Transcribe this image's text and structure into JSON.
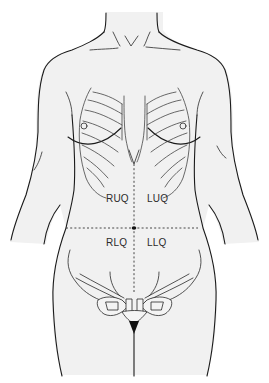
{
  "figure": {
    "colors": {
      "background": "#ffffff",
      "skin_fill": "#f1f1f1",
      "outline": "#1b1b1b",
      "divider_lines": "#333333",
      "label_text": "#2b2b2b"
    },
    "dividers": {
      "vertical": "midline (dashed)",
      "horizontal": "transumbilical line (dashed)",
      "intersection": "umbilicus"
    },
    "quadrants": [
      {
        "id": "ruq",
        "label": "RUQ"
      },
      {
        "id": "luq",
        "label": "LUQ"
      },
      {
        "id": "rlq",
        "label": "RLQ"
      },
      {
        "id": "llq",
        "label": "LLQ"
      }
    ]
  }
}
